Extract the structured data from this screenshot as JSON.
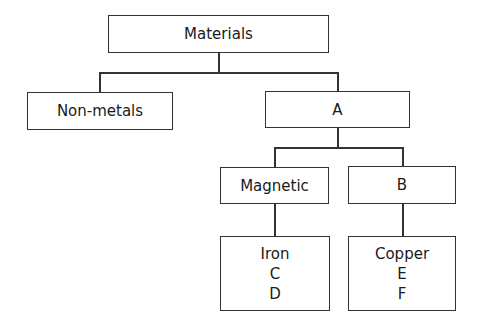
{
  "diagram": {
    "type": "hierarchy-tree",
    "nodes": {
      "root": {
        "label": "Materials"
      },
      "non_metals": {
        "label": "Non-metals"
      },
      "a": {
        "label": "A"
      },
      "magnetic": {
        "label": "Magnetic"
      },
      "b": {
        "label": "B"
      },
      "magnetic_examples": {
        "lines": [
          "Iron",
          "C",
          "D"
        ]
      },
      "b_examples": {
        "lines": [
          "Copper",
          "E",
          "F"
        ]
      }
    },
    "edges": [
      [
        "Materials",
        "Non-metals"
      ],
      [
        "Materials",
        "A"
      ],
      [
        "A",
        "Magnetic"
      ],
      [
        "A",
        "B"
      ],
      [
        "Magnetic",
        "Iron / C / D"
      ],
      [
        "B",
        "Copper / E / F"
      ]
    ]
  }
}
